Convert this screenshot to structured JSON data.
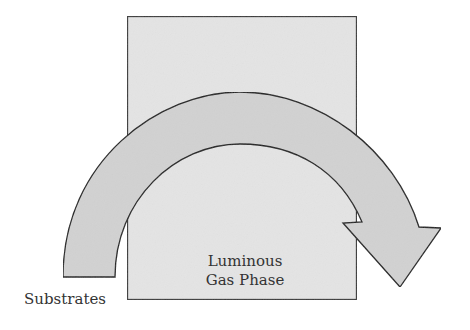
{
  "diagram": {
    "box": {
      "label_line1": "Luminous",
      "label_line2": "Gas Phase",
      "fill": "#e4e4e4",
      "stroke": "#3a3a3a"
    },
    "arrow": {
      "fill": "#d2d2d2",
      "stroke": "#222222",
      "direction": "left-to-right over box"
    },
    "labels": {
      "substrates": "Substrates"
    }
  }
}
